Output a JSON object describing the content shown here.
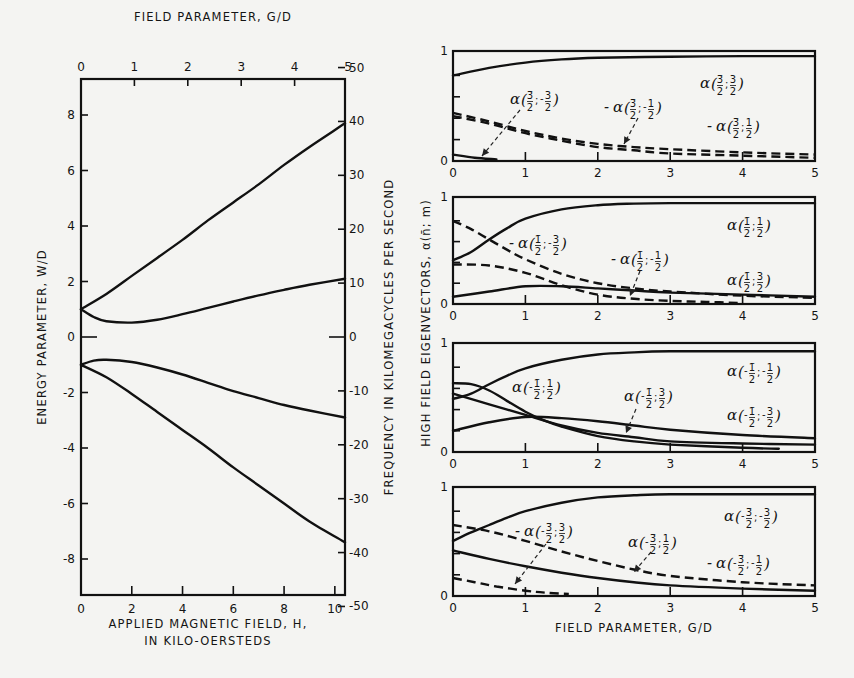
{
  "chart_data": [
    {
      "type": "line",
      "title": "Energy levels vs applied magnetic field",
      "xlabel_bottom": "APPLIED MAGNETIC FIELD, H,",
      "xlabel_bottom_line2": "IN KILO-OERSTEDS",
      "xlabel_top": "FIELD PARAMETER, G/D",
      "ylabel_left": "ENERGY PARAMETER, W/D",
      "ylabel_right": "FREQUENCY IN KILOMEGACYCLES PER SECOND",
      "x_bottom_ticks": [
        "0",
        "2",
        "4",
        "6",
        "8",
        "10"
      ],
      "x_top_ticks": [
        "0",
        "1",
        "2",
        "3",
        "4",
        "5"
      ],
      "y_left_ticks": [
        "8",
        "6",
        "4",
        "2",
        "0",
        "-2",
        "-4",
        "-6",
        "-8"
      ],
      "y_right_ticks": [
        "50",
        "40",
        "30",
        "20",
        "10",
        "0",
        "-10",
        "-20",
        "-30",
        "-40",
        "-50"
      ],
      "xlim": [
        0,
        10.4
      ],
      "ylim": [
        -9.3,
        9.3
      ],
      "grid": false,
      "series": [
        {
          "name": "upper level 1",
          "x": [
            0,
            1,
            2,
            3,
            4,
            5,
            6,
            7,
            8,
            9,
            10.4
          ],
          "y": [
            1.0,
            1.55,
            2.2,
            2.85,
            3.5,
            4.2,
            4.85,
            5.5,
            6.2,
            6.85,
            7.7
          ]
        },
        {
          "name": "upper level 2",
          "x": [
            0,
            0.5,
            1,
            2,
            3,
            4,
            5,
            6,
            7,
            8,
            9,
            10.4
          ],
          "y": [
            1.0,
            0.72,
            0.57,
            0.52,
            0.62,
            0.82,
            1.05,
            1.28,
            1.5,
            1.7,
            1.88,
            2.1
          ]
        },
        {
          "name": "lower level 1",
          "x": [
            0,
            0.5,
            1,
            2,
            3,
            4,
            5,
            6,
            7,
            8,
            9,
            10.4
          ],
          "y": [
            -1.0,
            -0.85,
            -0.82,
            -0.9,
            -1.1,
            -1.35,
            -1.65,
            -1.95,
            -2.2,
            -2.45,
            -2.65,
            -2.9
          ]
        },
        {
          "name": "lower level 2",
          "x": [
            0,
            1,
            2,
            3,
            4,
            5,
            6,
            7,
            8,
            9,
            10.4
          ],
          "y": [
            -1.0,
            -1.45,
            -2.05,
            -2.7,
            -3.35,
            -4.0,
            -4.7,
            -5.35,
            -6.0,
            -6.65,
            -7.4
          ]
        }
      ]
    },
    {
      "type": "line",
      "panel": 1,
      "xlabel": "",
      "ylabel": "HIGH FIELD EIGENVECTORS, α(n̄; m)",
      "x_ticks": [
        "0",
        "1",
        "2",
        "3",
        "4",
        "5"
      ],
      "y_ticks": [
        "0",
        "1"
      ],
      "xlim": [
        0,
        5
      ],
      "ylim": [
        0,
        1
      ],
      "series": [
        {
          "name": "α(3̄/2; 3/2)",
          "style": "solid",
          "x": [
            0,
            0.5,
            1,
            1.5,
            2,
            3,
            4,
            5
          ],
          "y": [
            0.8,
            0.87,
            0.92,
            0.95,
            0.965,
            0.975,
            0.98,
            0.98
          ]
        },
        {
          "name": "-α(3̄/2; 1/2)",
          "style": "dashed",
          "x": [
            0,
            0.5,
            1,
            1.5,
            2,
            2.5,
            3,
            4,
            5
          ],
          "y": [
            0.45,
            0.37,
            0.28,
            0.21,
            0.16,
            0.13,
            0.11,
            0.08,
            0.06
          ]
        },
        {
          "name": "-α(3̄/2; -1/2)",
          "style": "dashed",
          "x": [
            0,
            0.5,
            1,
            1.5,
            2,
            2.5,
            3,
            4,
            5
          ],
          "y": [
            0.42,
            0.35,
            0.26,
            0.19,
            0.13,
            0.1,
            0.07,
            0.05,
            0.03
          ]
        },
        {
          "name": "α(3̄/2; -3/2)",
          "style": "solid",
          "x": [
            0,
            0.3,
            0.6
          ],
          "y": [
            0.06,
            0.03,
            0.015
          ]
        }
      ]
    },
    {
      "type": "line",
      "panel": 2,
      "x_ticks": [
        "0",
        "1",
        "2",
        "3",
        "4",
        "5"
      ],
      "y_ticks": [
        "0",
        "1"
      ],
      "xlim": [
        0,
        5
      ],
      "ylim": [
        0,
        1
      ],
      "series": [
        {
          "name": "α(1̄/2; 1/2)",
          "style": "solid",
          "x": [
            0,
            0.25,
            0.5,
            0.75,
            1,
            1.5,
            2,
            2.5,
            3,
            4,
            5
          ],
          "y": [
            0.42,
            0.5,
            0.62,
            0.73,
            0.82,
            0.91,
            0.95,
            0.965,
            0.97,
            0.97,
            0.97
          ]
        },
        {
          "name": "-α(1̄/2; -3/2)",
          "style": "dashed",
          "x": [
            0,
            0.25,
            0.5,
            0.75,
            1,
            1.5,
            2,
            2.5,
            3,
            4,
            5
          ],
          "y": [
            0.8,
            0.72,
            0.62,
            0.52,
            0.43,
            0.29,
            0.2,
            0.15,
            0.12,
            0.08,
            0.06
          ]
        },
        {
          "name": "-α(1̄/2; -1/2)",
          "style": "dashed",
          "x": [
            0,
            0.5,
            1,
            1.5,
            2,
            2.5,
            3,
            3.5,
            4
          ],
          "y": [
            0.38,
            0.37,
            0.3,
            0.18,
            0.09,
            0.05,
            0.03,
            0.02,
            0.01
          ]
        },
        {
          "name": "α(1̄/2; 3/2)",
          "style": "solid",
          "x": [
            0,
            0.5,
            1,
            1.5,
            2,
            2.5,
            3,
            4,
            5
          ],
          "y": [
            0.07,
            0.12,
            0.17,
            0.17,
            0.15,
            0.13,
            0.11,
            0.09,
            0.07
          ]
        }
      ]
    },
    {
      "type": "line",
      "panel": 3,
      "x_ticks": [
        "0",
        "1",
        "2",
        "3",
        "4",
        "5"
      ],
      "y_ticks": [
        "0",
        "1"
      ],
      "xlim": [
        0,
        5
      ],
      "ylim": [
        0,
        1
      ],
      "series": [
        {
          "name": "α(-1̄/2; -1/2)",
          "style": "solid",
          "x": [
            0,
            0.25,
            0.5,
            0.75,
            1,
            1.5,
            2,
            2.5,
            3,
            4,
            5
          ],
          "y": [
            0.5,
            0.55,
            0.64,
            0.72,
            0.79,
            0.87,
            0.92,
            0.94,
            0.95,
            0.95,
            0.95
          ]
        },
        {
          "name": "α(-1̄/2; 1/2)",
          "style": "solid",
          "x": [
            0,
            0.25,
            0.5,
            0.75,
            1,
            1.25,
            1.5,
            2,
            2.5,
            3,
            4,
            4.5
          ],
          "y": [
            0.65,
            0.64,
            0.58,
            0.48,
            0.38,
            0.3,
            0.24,
            0.15,
            0.1,
            0.07,
            0.04,
            0.03
          ]
        },
        {
          "name": "α(-1̄/2; -3/2)",
          "style": "solid",
          "x": [
            0,
            0.5,
            1,
            1.5,
            2,
            2.5,
            3,
            4,
            5
          ],
          "y": [
            0.55,
            0.45,
            0.35,
            0.25,
            0.18,
            0.14,
            0.1,
            0.08,
            0.07
          ]
        },
        {
          "name": "α(-1̄/2; 3/2)",
          "style": "solid",
          "x": [
            0,
            0.5,
            1,
            1.5,
            2,
            2.5,
            3,
            4,
            5
          ],
          "y": [
            0.2,
            0.28,
            0.33,
            0.32,
            0.29,
            0.25,
            0.21,
            0.16,
            0.13
          ]
        }
      ]
    },
    {
      "type": "line",
      "panel": 4,
      "xlabel": "FIELD PARAMETER, G/D",
      "x_ticks": [
        "0",
        "1",
        "2",
        "3",
        "4",
        "5"
      ],
      "y_ticks": [
        "0",
        "1"
      ],
      "xlim": [
        0,
        5
      ],
      "ylim": [
        0,
        1
      ],
      "series": [
        {
          "name": "α(-3̄/2; -3/2)",
          "style": "solid",
          "x": [
            0,
            0.25,
            0.5,
            0.75,
            1,
            1.5,
            2,
            2.5,
            3,
            4,
            5
          ],
          "y": [
            0.52,
            0.6,
            0.67,
            0.74,
            0.8,
            0.88,
            0.93,
            0.95,
            0.96,
            0.96,
            0.96
          ]
        },
        {
          "name": "-α(-3̄/2; -1/2)",
          "style": "dashed",
          "x": [
            0,
            0.5,
            1,
            1.5,
            2,
            2.5,
            3,
            4,
            5
          ],
          "y": [
            0.67,
            0.61,
            0.52,
            0.42,
            0.33,
            0.25,
            0.19,
            0.13,
            0.1
          ]
        },
        {
          "name": "α(-3̄/2; 1/2)",
          "style": "solid",
          "x": [
            0,
            0.5,
            1,
            1.5,
            2,
            2.5,
            3,
            4,
            5
          ],
          "y": [
            0.43,
            0.35,
            0.28,
            0.22,
            0.17,
            0.13,
            0.1,
            0.07,
            0.05
          ]
        },
        {
          "name": "-α(-3̄/2; 3/2)",
          "style": "dashed",
          "x": [
            0,
            0.3,
            0.6,
            1,
            1.3,
            1.6
          ],
          "y": [
            0.17,
            0.13,
            0.09,
            0.05,
            0.03,
            0.02
          ]
        }
      ]
    }
  ],
  "left_chart": {
    "top_axis_title": "FIELD PARAMETER, G/D",
    "left_axis_title": "ENERGY PARAMETER, W/D",
    "right_axis_title": "FREQUENCY IN KILOMEGACYCLES PER SECOND",
    "bottom_axis_title_line1": "APPLIED MAGNETIC FIELD, H,",
    "bottom_axis_title_line2": "IN KILO-OERSTEDS"
  },
  "right_chart": {
    "y_axis_title": "HIGH FIELD EIGENVECTORS, α(n̄; m)",
    "x_axis_title": "FIELD PARAMETER, G/D",
    "annotations": [
      {
        "panel": 1,
        "prefix": "",
        "n": "3̄",
        "m_sign": "",
        "m": "3",
        "x": 700,
        "y": 88
      },
      {
        "panel": 1,
        "prefix": "",
        "n": "3̄",
        "m_sign": "-",
        "m": "3",
        "x": 510,
        "y": 104
      },
      {
        "panel": 1,
        "prefix": "-",
        "n": "3̄",
        "m_sign": "-",
        "m": "1",
        "x": 613,
        "y": 112
      },
      {
        "panel": 1,
        "prefix": "-",
        "n": "3̄",
        "m_sign": "",
        "m": "1",
        "x": 716,
        "y": 131
      },
      {
        "panel": 2,
        "prefix": "",
        "n": "1̄",
        "m_sign": "",
        "m": "1",
        "x": 727,
        "y": 230
      },
      {
        "panel": 2,
        "prefix": "-",
        "n": "1̄",
        "m_sign": "-",
        "m": "3",
        "x": 518,
        "y": 248
      },
      {
        "panel": 2,
        "prefix": "-",
        "n": "1̄",
        "m_sign": "-",
        "m": "1",
        "x": 620,
        "y": 264
      },
      {
        "panel": 2,
        "prefix": "",
        "n": "1̄",
        "m_sign": "",
        "m": "3",
        "x": 727,
        "y": 285
      },
      {
        "panel": 3,
        "prefix": "",
        "n": "-1̄",
        "m_sign": "-",
        "m": "1",
        "x": 727,
        "y": 376
      },
      {
        "panel": 3,
        "prefix": "",
        "n": "-1̄",
        "m_sign": "",
        "m": "1",
        "x": 512,
        "y": 392
      },
      {
        "panel": 3,
        "prefix": "",
        "n": "-1̄",
        "m_sign": "",
        "m": "3",
        "x": 624,
        "y": 401
      },
      {
        "panel": 3,
        "prefix": "",
        "n": "-1̄",
        "m_sign": "-",
        "m": "3",
        "x": 727,
        "y": 420
      },
      {
        "panel": 4,
        "prefix": "",
        "n": "-3̄",
        "m_sign": "-",
        "m": "3",
        "x": 724,
        "y": 521
      },
      {
        "panel": 4,
        "prefix": "-",
        "n": "-3̄",
        "m_sign": "",
        "m": "3",
        "x": 524,
        "y": 536
      },
      {
        "panel": 4,
        "prefix": "",
        "n": "-3̄",
        "m_sign": "",
        "m": "1",
        "x": 628,
        "y": 547
      },
      {
        "panel": 4,
        "prefix": "-",
        "n": "-3̄",
        "m_sign": "-",
        "m": "1",
        "x": 716,
        "y": 568
      }
    ]
  },
  "layout": {
    "left_frame": {
      "x0": 81,
      "y0": 79,
      "x1": 345,
      "y1": 595,
      "h_per_px": 0.03906,
      "h0_x": 81,
      "w_zero_y": 337,
      "w_px_per_unit": 27.75
    },
    "panels": [
      {
        "x0": 453,
        "x1": 815,
        "y0": 51,
        "y1": 161
      },
      {
        "x0": 453,
        "x1": 815,
        "y0": 197,
        "y1": 304
      },
      {
        "x0": 453,
        "x1": 815,
        "y0": 343,
        "y1": 452
      },
      {
        "x0": 453,
        "x1": 815,
        "y0": 487,
        "y1": 596
      }
    ],
    "colors": {
      "ink": "#111111",
      "paper": "#f4f4f2"
    }
  }
}
